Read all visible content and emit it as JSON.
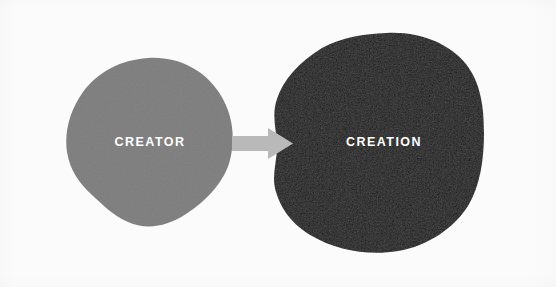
{
  "diagram": {
    "background_color": "#fbfbfb",
    "nodes": [
      {
        "id": "creator",
        "label": "CREATOR",
        "shape": "organic-blob",
        "fill_color": "#7c7c7c",
        "text_color": "#ffffff",
        "center_x": 150,
        "center_y": 141,
        "width": 168,
        "height": 167
      },
      {
        "id": "creation",
        "label": "CREATION",
        "shape": "organic-blob",
        "fill_color": "#161616",
        "text_color": "#ffffff",
        "center_x": 384,
        "center_y": 141,
        "width": 212,
        "height": 215
      }
    ],
    "connector": {
      "id": "creator-to-creation",
      "type": "arrow",
      "direction": "right",
      "fill_color": "#b9b9b9",
      "from": "creator",
      "to": "creation",
      "start_x": 232,
      "end_x": 293,
      "center_y": 143
    }
  }
}
